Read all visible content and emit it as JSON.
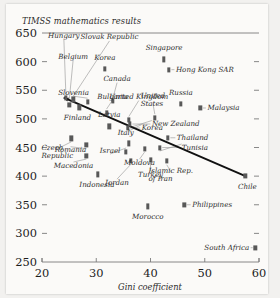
{
  "chart_data": {
    "type": "scatter",
    "title": "TIMSS mathematics results",
    "xlabel": "Gini coefficient",
    "ylabel": "",
    "xlim": [
      20,
      60
    ],
    "ylim": [
      250,
      650
    ],
    "xticks": [
      20,
      30,
      40,
      50,
      60
    ],
    "yticks": [
      250,
      300,
      350,
      400,
      450,
      500,
      550,
      600,
      650
    ],
    "grid": false,
    "legend": "none",
    "trendline": {
      "label": "regression line",
      "x_start": 24.0,
      "y_start": 537,
      "x_end": 57.5,
      "y_end": 400,
      "arrow_start": true
    },
    "points": [
      {
        "country": "Hungary",
        "gini": 24.4,
        "score": 537,
        "label_pos": "c"
      },
      {
        "country": "Belgium",
        "gini": 25.0,
        "score": 525,
        "label_pos": "c"
      },
      {
        "country": "Slovak Republic",
        "gini": 25.8,
        "score": 534,
        "label_pos": "c"
      },
      {
        "country": "Korea",
        "gini": 31.6,
        "score": 587,
        "label_pos": "c"
      },
      {
        "country": "Canada",
        "gini": 33.1,
        "score": 531,
        "label_pos": "c"
      },
      {
        "country": "Slovenia",
        "gini": 28.4,
        "score": 530,
        "label_pos": "c"
      },
      {
        "country": "Bulgaria",
        "gini": 31.9,
        "score": 511,
        "label_pos": "c"
      },
      {
        "country": "Singapore",
        "gini": 42.5,
        "score": 604,
        "label_pos": "c"
      },
      {
        "country": "Hong Kong SAR",
        "gini": 43.4,
        "score": 586,
        "label_pos": "l"
      },
      {
        "country": "United Kingdom",
        "gini": 36.0,
        "score": 498,
        "label_pos": "c"
      },
      {
        "country": "United States",
        "gini": 40.8,
        "score": 502,
        "label_pos": "c"
      },
      {
        "country": "Russia",
        "gini": 45.6,
        "score": 526,
        "label_pos": "c"
      },
      {
        "country": "Malaysia",
        "gini": 49.2,
        "score": 519,
        "label_pos": "l"
      },
      {
        "country": "New Zealand",
        "gini": 36.2,
        "score": 491,
        "label_pos": "l"
      },
      {
        "country": "Korea",
        "gini": 35.8,
        "score": 484,
        "label_pos": "l"
      },
      {
        "country": "Thailand",
        "gini": 43.2,
        "score": 467,
        "label_pos": "l"
      },
      {
        "country": "Finland",
        "gini": 26.9,
        "score": 520,
        "label_pos": "c"
      },
      {
        "country": "Latvia",
        "gini": 32.4,
        "score": 487,
        "label_pos": "c"
      },
      {
        "country": "Czech Republic",
        "gini": 25.4,
        "score": 466,
        "label_pos": "c"
      },
      {
        "country": "Romania",
        "gini": 28.2,
        "score": 454,
        "label_pos": "c"
      },
      {
        "country": "Macedonia",
        "gini": 28.2,
        "score": 436,
        "label_pos": "c"
      },
      {
        "country": "Indonesia",
        "gini": 30.3,
        "score": 403,
        "label_pos": "c"
      },
      {
        "country": "Israel",
        "gini": 35.5,
        "score": 443,
        "label_pos": "c"
      },
      {
        "country": "Italy",
        "gini": 36.0,
        "score": 457,
        "label_pos": "c"
      },
      {
        "country": "Tunisia",
        "gini": 41.7,
        "score": 450,
        "label_pos": "l"
      },
      {
        "country": "Moldova",
        "gini": 38.9,
        "score": 448,
        "label_pos": "c"
      },
      {
        "country": "Jordan",
        "gini": 36.4,
        "score": 427,
        "label_pos": "c"
      },
      {
        "country": "Turkey",
        "gini": 40.0,
        "score": 429,
        "label_pos": "c"
      },
      {
        "country": "Islamic Rep. of Iran",
        "gini": 43.0,
        "score": 426,
        "label_pos": "c"
      },
      {
        "country": "Chile",
        "gini": 57.5,
        "score": 400,
        "label_pos": "c"
      },
      {
        "country": "Morocco",
        "gini": 39.5,
        "score": 347,
        "label_pos": "c"
      },
      {
        "country": "Philippines",
        "gini": 46.2,
        "score": 350,
        "label_pos": "l"
      },
      {
        "country": "South Africa",
        "gini": 59.3,
        "score": 275,
        "label_pos": "r"
      }
    ]
  },
  "axes": {
    "title": "TIMSS mathematics results",
    "xlabel": "Gini coefficient",
    "ytick_labels": [
      "650",
      "600",
      "550",
      "500",
      "450",
      "400",
      "350",
      "300",
      "250"
    ],
    "xtick_labels": [
      "20",
      "30",
      "40",
      "50",
      "60"
    ]
  },
  "colors": {
    "paper": "#fbfaf8",
    "backdrop": "#f2f1ef",
    "marker": "#585858",
    "trendline": "#111111",
    "axis": "#7a7a7a",
    "text": "#1d1d1d"
  }
}
